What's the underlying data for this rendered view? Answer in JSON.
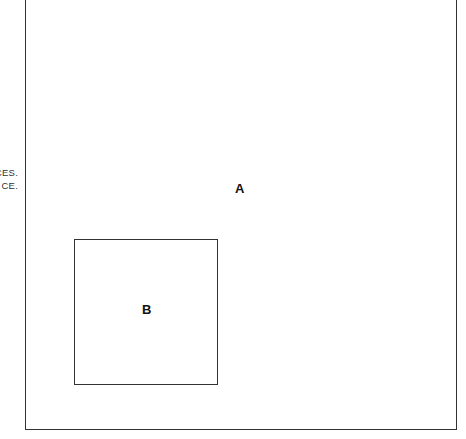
{
  "left_margin_text": {
    "line1": "CES.",
    "line2": "CE."
  },
  "diagram": {
    "outer_region": {
      "label": "A"
    },
    "inner_region": {
      "label": "B"
    }
  }
}
